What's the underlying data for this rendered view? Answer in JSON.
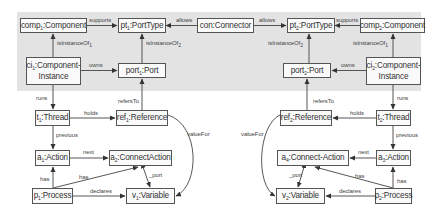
{
  "diagram": {
    "band_color": "#e3e3e3",
    "stroke_color": "#555555",
    "nodes": {
      "comp1": {
        "name": "comp",
        "sub": "1",
        "type": ":Component"
      },
      "pt1": {
        "name": "pt",
        "sub": "1",
        "type": ":PortType"
      },
      "con": {
        "name": "con",
        "sub": "",
        "type": ":Connector"
      },
      "pt2": {
        "name": "pt",
        "sub": "2",
        "type": ":PortType"
      },
      "comp2": {
        "name": "comp",
        "sub": "2",
        "type": ":Component"
      },
      "ci1": {
        "name": "ci",
        "sub": "1",
        "type": ":Component-",
        "type2": "Instance"
      },
      "port1": {
        "name": "port",
        "sub": "1",
        "type": ":Port"
      },
      "port2": {
        "name": "port",
        "sub": "2",
        "type": ":Port"
      },
      "ci2": {
        "name": "ci",
        "sub": "2",
        "type": ":Component-",
        "type2": "Instance"
      },
      "t1": {
        "name": "t",
        "sub": "1",
        "type": ":Thread"
      },
      "ref1": {
        "name": "ref",
        "sub": "1",
        "type": ":Reference"
      },
      "ref2": {
        "name": "ref",
        "sub": "2",
        "type": ":Reference"
      },
      "t2": {
        "name": "t",
        "sub": "2",
        "type": ":Thread"
      },
      "a1": {
        "name": "a",
        "sub": "1",
        "type": ":Action"
      },
      "a2": {
        "name": "a",
        "sub": "2",
        "type": ":ConnectAction"
      },
      "a4": {
        "name": "a",
        "sub": "4",
        "type": ":Connect-Action"
      },
      "a3": {
        "name": "a",
        "sub": "3",
        "type": ":Action"
      },
      "p1": {
        "name": "p",
        "sub": "1",
        "type": ":Process"
      },
      "v1": {
        "name": "v",
        "sub": "1",
        "type": ":Variable"
      },
      "v2": {
        "name": "v",
        "sub": "2",
        "type": ":Variable"
      },
      "p2": {
        "name": "p",
        "sub": "2",
        "type": ":Process"
      }
    },
    "edges": {
      "supports1": "supports",
      "allows1": "allows",
      "allows2": "allows",
      "supports2": "supports",
      "isInstanceOf_comp1": "isInstanceOf",
      "isInstanceOf_comp1_sub": "1",
      "isInstanceOf_pt1": "isInstanceOf",
      "isInstanceOf_pt1_sub": "2",
      "isInstanceOf_pt2": "isInstanceOf",
      "isInstanceOf_pt2_sub": "2",
      "isInstanceOf_comp2": "isInstanceOf",
      "isInstanceOf_comp2_sub": "1",
      "owns1": "owns",
      "owns2": "owns",
      "runs1": "runs",
      "runs2": "runs",
      "refersTo1": "refersTo",
      "refersTo2": "refersTo",
      "holds1": "holds",
      "holds2": "holds",
      "valueFor1": "valueFor",
      "valueFor2": "valueFor",
      "previous1": "previous",
      "previous2": "previous",
      "next1": "next",
      "next2": "next",
      "port1": "_port",
      "port2": "_port",
      "has1a": "has",
      "has1b": "has",
      "has2a": "has",
      "has2b": "has",
      "declares1": "declares",
      "declares2": "declares"
    }
  }
}
